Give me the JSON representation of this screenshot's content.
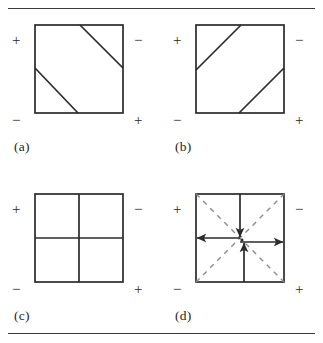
{
  "figure": {
    "width": 323,
    "height": 343,
    "background": "#ffffff",
    "line_color": "#2b2b2b",
    "rule_color": "#3a3a3a",
    "rules": [
      {
        "name": "top-rule",
        "y": 8
      },
      {
        "name": "bottom-rule",
        "y": 333
      }
    ]
  },
  "panels": [
    {
      "id": "a",
      "caption": "(a)",
      "corner_signs": {
        "top_left": "+",
        "top_right": "−",
        "bottom_left": "−",
        "bottom_right": "+"
      },
      "square": {
        "x": 8,
        "y": 8,
        "size": 88
      },
      "internal_lines": [
        {
          "name": "upper-diagonal",
          "style": "solid",
          "x1": 53,
          "y1": 8,
          "x2": 96,
          "y2": 51
        },
        {
          "name": "lower-diagonal",
          "style": "solid",
          "x1": 8,
          "y1": 51,
          "x2": 51,
          "y2": 96
        }
      ],
      "arrows": []
    },
    {
      "id": "b",
      "caption": "(b)",
      "corner_signs": {
        "top_left": "+",
        "top_right": "−",
        "bottom_left": "−",
        "bottom_right": "+"
      },
      "square": {
        "x": 8,
        "y": 8,
        "size": 88
      },
      "internal_lines": [
        {
          "name": "upper-diagonal",
          "style": "solid",
          "x1": 8,
          "y1": 53,
          "x2": 53,
          "y2": 8
        },
        {
          "name": "lower-diagonal",
          "style": "solid",
          "x1": 51,
          "y1": 96,
          "x2": 96,
          "y2": 51
        }
      ],
      "arrows": []
    },
    {
      "id": "c",
      "caption": "(c)",
      "corner_signs": {
        "top_left": "+",
        "top_right": "−",
        "bottom_left": "−",
        "bottom_right": "+"
      },
      "square": {
        "x": 8,
        "y": 8,
        "size": 88
      },
      "internal_lines": [
        {
          "name": "vertical-midline",
          "style": "solid",
          "x1": 52,
          "y1": 8,
          "x2": 52,
          "y2": 96
        },
        {
          "name": "horizontal-midline",
          "style": "solid",
          "x1": 8,
          "y1": 52,
          "x2": 96,
          "y2": 52
        }
      ],
      "arrows": []
    },
    {
      "id": "d",
      "caption": "(d)",
      "corner_signs": {
        "top_left": "+",
        "top_right": "−",
        "bottom_left": "−",
        "bottom_right": "+"
      },
      "square": {
        "x": 8,
        "y": 8,
        "size": 88
      },
      "internal_lines": [
        {
          "name": "dashed-diagonal-nw-se",
          "style": "dashed",
          "x1": 8,
          "y1": 8,
          "x2": 96,
          "y2": 96
        },
        {
          "name": "dashed-diagonal-sw-ne",
          "style": "dashed",
          "x1": 8,
          "y1": 96,
          "x2": 96,
          "y2": 8
        }
      ],
      "arrows": [
        {
          "name": "arrow-down",
          "direction": "down",
          "x1": 52,
          "y1": 8,
          "x2": 52,
          "y2": 52
        },
        {
          "name": "arrow-left",
          "direction": "left",
          "x1": 52,
          "y1": 52,
          "x2": 8,
          "y2": 52
        },
        {
          "name": "arrow-right",
          "direction": "right",
          "x1": 52,
          "y1": 56,
          "x2": 96,
          "y2": 56
        },
        {
          "name": "arrow-up",
          "direction": "up",
          "x1": 56,
          "y1": 96,
          "x2": 56,
          "y2": 56
        }
      ]
    }
  ]
}
